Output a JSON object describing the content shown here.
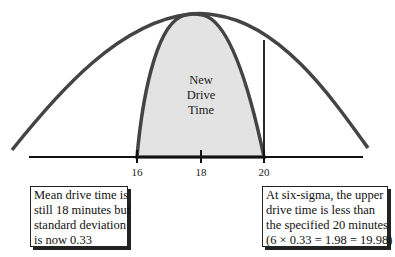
{
  "diagram": {
    "center_label": [
      "New",
      "Drive",
      "Time"
    ],
    "axis_ticks": [
      {
        "label": "16",
        "x": 137
      },
      {
        "label": "18",
        "x": 201
      },
      {
        "label": "20",
        "x": 264
      }
    ],
    "notes": {
      "left": [
        "Mean drive time is",
        "still 18 minutes but",
        "standard deviation",
        "is now 0.33"
      ],
      "right": [
        "At six-sigma, the upper",
        "drive time is less than",
        "the specified 20 minutes",
        "(6 × 0.33 = 1.98 = 19.98)"
      ]
    },
    "colors": {
      "curve": "#444444",
      "fill": "#e3e3e3",
      "axis": "#111111"
    }
  }
}
